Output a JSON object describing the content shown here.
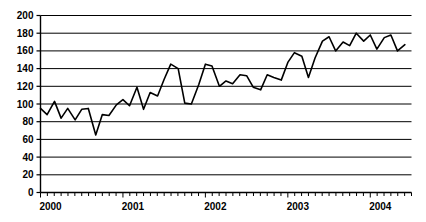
{
  "chart_data": {
    "type": "line",
    "title": "",
    "subtitle": "",
    "xlabel": "",
    "ylabel": "",
    "ylim": [
      0,
      200
    ],
    "ytick_step": 20,
    "yticks": [
      0,
      20,
      40,
      60,
      80,
      100,
      120,
      140,
      160,
      180,
      200
    ],
    "xtick_labels": [
      "2000",
      "2001",
      "2002",
      "2003",
      "2004"
    ],
    "x_minor_ticks": "monthly",
    "grid": true,
    "grid_axis": "y",
    "legend": false,
    "legend_position": "none",
    "line_color": "#000000",
    "line_width": 1.6,
    "markers": false,
    "background_color": "#ffffff",
    "axis_color": "#000000",
    "series": [
      {
        "name": "series-1",
        "x": [
          2000.0,
          2000.08,
          2000.17,
          2000.25,
          2000.33,
          2000.42,
          2000.5,
          2000.58,
          2000.67,
          2000.75,
          2000.83,
          2000.92,
          2001.0,
          2001.08,
          2001.17,
          2001.25,
          2001.33,
          2001.42,
          2001.5,
          2001.58,
          2001.67,
          2001.75,
          2001.83,
          2001.92,
          2002.0,
          2002.08,
          2002.17,
          2002.25,
          2002.33,
          2002.42,
          2002.5,
          2002.58,
          2002.67,
          2002.75,
          2002.83,
          2002.92,
          2003.0,
          2003.08,
          2003.17,
          2003.25,
          2003.33,
          2003.42,
          2003.5,
          2003.58,
          2003.67,
          2003.75,
          2003.83,
          2003.92,
          2004.0,
          2004.08,
          2004.17,
          2004.25,
          2004.33,
          2004.42
        ],
        "values": [
          95,
          88,
          103,
          84,
          95,
          82,
          94,
          95,
          65,
          88,
          87,
          99,
          105,
          98,
          119,
          94,
          113,
          109,
          128,
          145,
          140,
          101,
          100,
          122,
          145,
          143,
          120,
          126,
          123,
          133,
          132,
          119,
          116,
          133,
          130,
          127,
          147,
          158,
          154,
          130,
          152,
          171,
          176,
          160,
          170,
          166,
          180,
          171,
          178,
          162,
          175,
          178,
          160,
          167
        ]
      }
    ]
  }
}
